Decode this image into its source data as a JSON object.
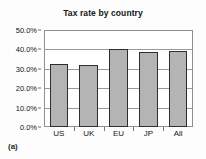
{
  "figure": {
    "caption_label": "(a)"
  },
  "chart_data": {
    "type": "bar",
    "title": "Tax rate by country",
    "xlabel": "",
    "ylabel": "",
    "categories": [
      "US",
      "UK",
      "EU",
      "JP",
      "All"
    ],
    "values": [
      32.5,
      32.0,
      40.2,
      38.6,
      39.0
    ],
    "value_labels": [
      "32.5%",
      "32.0%",
      "40.2%",
      "38.6%",
      "39.0%"
    ],
    "ylim": [
      0,
      50
    ],
    "yticks": [
      0,
      10,
      20,
      30,
      40,
      50
    ],
    "ytick_labels": [
      "0.0%",
      "10.0%",
      "20.0%",
      "30.0%",
      "40.0%",
      "50.0%"
    ],
    "grid": true,
    "legend": null,
    "bar_color": "#b4b4b4",
    "bar_border_color": "#2e2e2e",
    "axis_color": "#8f8f8f",
    "gridline_color": "#9a9a9a"
  }
}
